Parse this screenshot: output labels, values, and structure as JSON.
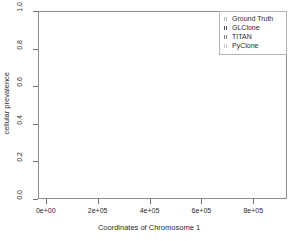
{
  "chart_data": {
    "type": "scatter",
    "title": "",
    "xlabel": "Coordinates of Chromosome 1",
    "ylabel": "cellular prevalence",
    "xlim": [
      -30000,
      930000
    ],
    "ylim": [
      0.0,
      1.0
    ],
    "grid": false,
    "legend_position": "top-right",
    "xticks": [
      "0e+00",
      "2e+05",
      "4e+05",
      "6e+05",
      "8e+05"
    ],
    "xtickvals": [
      0,
      200000,
      400000,
      600000,
      800000
    ],
    "yticks": [
      "0.0",
      "0.2",
      "0.4",
      "0.6",
      "0.8",
      "1.0"
    ],
    "ytickvals": [
      0.0,
      0.2,
      0.4,
      0.6,
      0.8,
      1.0
    ],
    "legend": [
      {
        "label": "Ground Truth",
        "color": "#b9b9b9"
      },
      {
        "label": "GLClone",
        "color": "#4f4f4f"
      },
      {
        "label": "TITAN",
        "color": "#868686"
      },
      {
        "label": "PyClone",
        "color": "#c9c9c9"
      }
    ],
    "series": [
      {
        "name": "Ground Truth",
        "color": "#b9b9b9",
        "y_level": 0.7,
        "segments": [
          {
            "x0": 8000,
            "x1": 52000
          },
          {
            "x0": 72000,
            "x1": 104000
          },
          {
            "x0": 126000,
            "x1": 158000
          },
          {
            "x0": 180000,
            "x1": 212000
          },
          {
            "x0": 234000,
            "x1": 272000
          },
          {
            "x0": 292000,
            "x1": 340000
          },
          {
            "x0": 360000,
            "x1": 418000
          },
          {
            "x0": 432000,
            "x1": 452000
          },
          {
            "x0": 478000,
            "x1": 500000
          },
          {
            "x0": 524000,
            "x1": 562000
          },
          {
            "x0": 580000,
            "x1": 604000
          },
          {
            "x0": 624000,
            "x1": 652000
          },
          {
            "x0": 676000,
            "x1": 700000
          },
          {
            "x0": 716000,
            "x1": 748000
          },
          {
            "x0": 768000,
            "x1": 812000
          },
          {
            "x0": 868000,
            "x1": 888000
          }
        ]
      },
      {
        "name": "GLClone",
        "color": "#4f4f4f",
        "y_level": 0.662,
        "segments": [
          {
            "x0": 8000,
            "x1": 52000
          },
          {
            "x0": 72000,
            "x1": 104000
          },
          {
            "x0": 126000,
            "x1": 158000
          },
          {
            "x0": 180000,
            "x1": 212000
          },
          {
            "x0": 234000,
            "x1": 272000
          },
          {
            "x0": 292000,
            "x1": 340000
          }
        ]
      },
      {
        "name": "TITAN",
        "color": "#868686",
        "y_level": 0.302,
        "segments": [
          {
            "x0": 392000,
            "x1": 440000
          },
          {
            "x0": 452000,
            "x1": 492000
          },
          {
            "x0": 512000,
            "x1": 536000
          },
          {
            "x0": 556000,
            "x1": 592000
          },
          {
            "x0": 604000,
            "x1": 636000
          },
          {
            "x0": 656000,
            "x1": 684000
          },
          {
            "x0": 700000,
            "x1": 744000
          },
          {
            "x0": 760000,
            "x1": 800000
          },
          {
            "x0": 812000,
            "x1": 836000
          },
          {
            "x0": 872000,
            "x1": 890000
          }
        ]
      },
      {
        "name": "GLClone-low",
        "color": "#4f4f4f",
        "y_level": 0.255,
        "segments": [
          {
            "x0": 392000,
            "x1": 440000
          },
          {
            "x0": 452000,
            "x1": 492000
          },
          {
            "x0": 512000,
            "x1": 536000
          },
          {
            "x0": 556000,
            "x1": 592000
          },
          {
            "x0": 604000,
            "x1": 636000
          },
          {
            "x0": 656000,
            "x1": 684000
          },
          {
            "x0": 700000,
            "x1": 744000
          },
          {
            "x0": 760000,
            "x1": 800000
          },
          {
            "x0": 812000,
            "x1": 836000
          },
          {
            "x0": 872000,
            "x1": 890000
          }
        ]
      },
      {
        "name": "PyClone",
        "color": "#c9c9c9",
        "y_level": 0.495,
        "segments": [
          {
            "x0": 8000,
            "x1": 60000
          },
          {
            "x0": 80000,
            "x1": 128000
          },
          {
            "x0": 140000,
            "x1": 196000
          },
          {
            "x0": 208000,
            "x1": 268000
          },
          {
            "x0": 280000,
            "x1": 344000
          },
          {
            "x0": 356000,
            "x1": 420000
          },
          {
            "x0": 432000,
            "x1": 500000
          },
          {
            "x0": 512000,
            "x1": 572000
          },
          {
            "x0": 584000,
            "x1": 648000
          },
          {
            "x0": 660000,
            "x1": 720000
          },
          {
            "x0": 732000,
            "x1": 800000
          },
          {
            "x0": 812000,
            "x1": 846000
          },
          {
            "x0": 868000,
            "x1": 892000
          }
        ]
      }
    ]
  },
  "axes": {
    "y_title": "cellular prevalence",
    "x_title": "Coordinates of Chromosome 1"
  }
}
